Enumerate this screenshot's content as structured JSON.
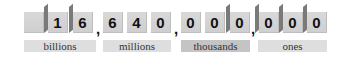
{
  "number": "16,640,000,000",
  "digits": [
    "",
    "1",
    "6",
    "6",
    "4",
    "0",
    "0",
    "0",
    "0",
    "0",
    "0",
    "0"
  ],
  "separators": [
    ",",
    ",",
    ","
  ],
  "periods": [
    {
      "label": "billions"
    },
    {
      "label": "millions"
    },
    {
      "label": "thousands"
    },
    {
      "label": "ones"
    }
  ],
  "colors": {
    "box_fill": "#d4d4d4",
    "label_fill": "#dedede",
    "label_fill_dark": "#c4c4c4",
    "flap": "#7a7a7a"
  }
}
